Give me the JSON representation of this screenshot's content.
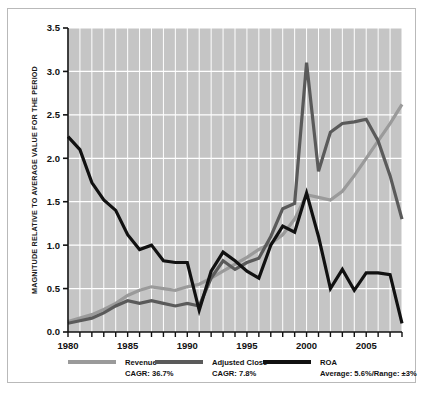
{
  "chart_data": {
    "type": "line",
    "title": "",
    "xlabel": "",
    "ylabel": "MAGNITUDE RELATIVE TO AVERAGE VALUE FOR THE PERIOD",
    "xlim": [
      1980,
      2008
    ],
    "ylim": [
      0.0,
      3.5
    ],
    "grid": true,
    "legend_position": "bottom",
    "xticks": [
      1980,
      1981,
      1982,
      1983,
      1984,
      1985,
      1986,
      1987,
      1988,
      1989,
      1990,
      1991,
      1992,
      1993,
      1994,
      1995,
      1996,
      1997,
      1998,
      1999,
      2000,
      2001,
      2002,
      2003,
      2004,
      2005,
      2006,
      2007,
      2008
    ],
    "xtick_labels": [
      "1980",
      "1985",
      "1990",
      "1995",
      "2000",
      "2005"
    ],
    "xtick_labels_values": [
      1980,
      1985,
      1990,
      1995,
      2000,
      2005
    ],
    "yticks": [
      0.0,
      0.5,
      1.0,
      1.5,
      2.0,
      2.5,
      3.0,
      3.5
    ],
    "ytick_labels": [
      "0.0",
      "0.5",
      "1.0",
      "1.5",
      "2.0",
      "2.5",
      "3.0",
      "3.5"
    ],
    "x": [
      1980,
      1981,
      1982,
      1983,
      1984,
      1985,
      1986,
      1987,
      1988,
      1989,
      1990,
      1991,
      1992,
      1993,
      1994,
      1995,
      1996,
      1997,
      1998,
      1999,
      2000,
      2001,
      2002,
      2003,
      2004,
      2005,
      2006,
      2007,
      2008
    ],
    "series": [
      {
        "name": "Revenue",
        "color": "#9a9a9a",
        "values": [
          0.12,
          0.16,
          0.2,
          0.26,
          0.33,
          0.42,
          0.48,
          0.52,
          0.5,
          0.48,
          0.52,
          0.55,
          0.62,
          0.7,
          0.78,
          0.86,
          0.95,
          1.02,
          1.12,
          1.3,
          1.58,
          1.55,
          1.52,
          1.62,
          1.8,
          2.0,
          2.2,
          2.4,
          2.62
        ]
      },
      {
        "name": "Adjusted Close",
        "color": "#5a5a5a",
        "values": [
          0.1,
          0.13,
          0.16,
          0.22,
          0.3,
          0.36,
          0.33,
          0.36,
          0.33,
          0.3,
          0.33,
          0.3,
          0.62,
          0.82,
          0.72,
          0.8,
          0.85,
          1.1,
          1.42,
          1.48,
          3.1,
          1.85,
          2.3,
          2.4,
          2.42,
          2.45,
          2.2,
          1.8,
          1.3
        ]
      },
      {
        "name": "ROA",
        "color": "#111111",
        "values": [
          2.25,
          2.1,
          1.72,
          1.52,
          1.4,
          1.12,
          0.95,
          1.0,
          0.82,
          0.8,
          0.8,
          0.25,
          0.7,
          0.92,
          0.82,
          0.7,
          0.62,
          1.0,
          1.22,
          1.15,
          1.6,
          1.1,
          0.5,
          0.72,
          0.48,
          0.68,
          0.68,
          0.66,
          0.1
        ]
      }
    ],
    "legend": [
      {
        "name": "revenue",
        "label": "Revenue",
        "sub": "CAGR: 36.7%",
        "color": "#9a9a9a"
      },
      {
        "name": "adjusted-close",
        "label": "Adjusted Close",
        "sub": "CAGR: 7.8%",
        "color": "#5a5a5a"
      },
      {
        "name": "roa",
        "label": "ROA",
        "sub": "Average: 5.6%/Range: ±3%",
        "color": "#111111"
      }
    ],
    "colors": {
      "plot_background": "#c5c5c5",
      "gridline": "#ffffff",
      "axis": "#111111",
      "figure_background": "#ffffff"
    }
  }
}
